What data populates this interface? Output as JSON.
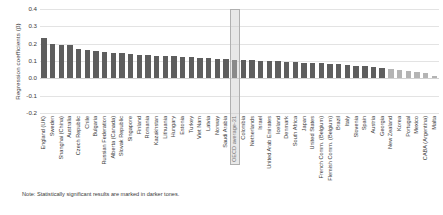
{
  "chart_data": {
    "type": "bar",
    "title": "",
    "xlabel": "",
    "ylabel": "Regression coefficients (β)",
    "ylim": [
      -0.2,
      0.4
    ],
    "ytick_labels": [
      "0.4",
      "0.3",
      "0.2",
      "0.1",
      "0.0",
      "-0.1",
      "-0.2"
    ],
    "ytick_values": [
      0.4,
      0.3,
      0.2,
      0.1,
      0.0,
      -0.1,
      -0.2
    ],
    "grid": true,
    "legend": "none",
    "note": "Note: Statistically significant results are marked in darker tones.",
    "highlight_category": "OECD average-31",
    "colors": {
      "significant": "#5e5e5e",
      "not_significant": "#b4b4b4",
      "highlight_box": "#b0b0b0",
      "gridline": "#e3e3e3",
      "text": "#3a3a3a"
    },
    "categories": [
      "England (UK)",
      "Sweden",
      "Shanghai (China)",
      "Australia",
      "Czech Republic",
      "Chile",
      "Bulgaria",
      "Russian Federation",
      "Alberta (Canada)",
      "Slovak Republic",
      "Singapore",
      "Finland",
      "Romania",
      "Kazakhstan",
      "Lithuania",
      "Hungary",
      "Estonia",
      "Turkey",
      "Viet Nam",
      "Latvia",
      "Norway",
      "Saudi Arabia",
      "OECD average-31",
      "Colombia",
      "Netherlands",
      "Israel",
      "United Arab Emirates",
      "Iceland",
      "Denmark",
      "South Africa",
      "Japan",
      "United States",
      "French Comm. (Belgium)",
      "Flemish Comm. (Belgium)",
      "Brazil",
      "Italy",
      "Slovenia",
      "Spain",
      "Austria",
      "Georgia",
      "New Zealand",
      "Korea",
      "Portugal",
      "Mexico",
      "CABA (Argentina)",
      "Malta"
    ],
    "values": [
      0.232,
      0.196,
      0.193,
      0.19,
      0.172,
      0.162,
      0.157,
      0.151,
      0.148,
      0.146,
      0.14,
      0.136,
      0.133,
      0.13,
      0.128,
      0.126,
      0.124,
      0.121,
      0.118,
      0.116,
      0.113,
      0.111,
      0.108,
      0.106,
      0.104,
      0.102,
      0.1,
      0.098,
      0.096,
      0.094,
      0.091,
      0.088,
      0.086,
      0.083,
      0.081,
      0.078,
      0.074,
      0.07,
      0.066,
      0.062,
      0.056,
      0.048,
      0.042,
      0.036,
      0.03,
      0.012
    ],
    "significant": [
      true,
      true,
      true,
      true,
      true,
      true,
      true,
      true,
      true,
      true,
      true,
      true,
      true,
      true,
      true,
      true,
      true,
      true,
      true,
      true,
      true,
      true,
      true,
      true,
      true,
      true,
      true,
      true,
      true,
      true,
      true,
      true,
      true,
      true,
      true,
      true,
      true,
      true,
      true,
      true,
      false,
      false,
      false,
      false,
      false,
      false
    ]
  }
}
